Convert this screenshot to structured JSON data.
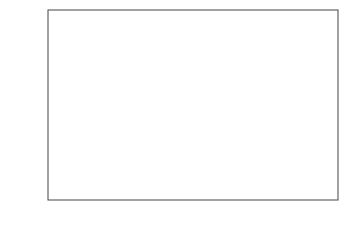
{
  "chart_data": {
    "type": "scatter",
    "title": "",
    "xlabel": "age",
    "ylabel": "ỹ",
    "xlim": [
      0.2,
      9.9
    ],
    "ylim": [
      8,
      95
    ],
    "xticks": [
      2,
      4,
      6,
      8
    ],
    "yticks": [
      20,
      40,
      60,
      80
    ],
    "grid": false,
    "legend": null,
    "fit_curve": {
      "x": [
        0.5,
        1.5,
        2.5,
        3.5,
        4.5,
        5.2,
        6,
        7,
        7.5,
        8.5,
        9.5
      ],
      "y": [
        23,
        35,
        46,
        54,
        59,
        60,
        59.5,
        55,
        52,
        43,
        31
      ]
    },
    "band_halfwidth": 15,
    "band_color": "#8c8c8c",
    "series": [
      {
        "age": 0.5,
        "y": [
          12,
          14,
          16,
          18,
          20,
          22,
          24,
          26,
          28,
          30,
          32,
          34,
          36,
          38,
          45
        ]
      },
      {
        "age": 1.5,
        "y": [
          30,
          32,
          34,
          36,
          38,
          40,
          42,
          44,
          46,
          48,
          50,
          52,
          54,
          56
        ]
      },
      {
        "age": 2.5,
        "y": [
          34,
          36,
          38,
          40,
          42,
          44,
          46,
          48,
          50,
          52,
          54,
          56,
          58,
          60,
          62,
          64,
          66,
          68,
          74
        ]
      },
      {
        "age": 3.5,
        "y": [
          36,
          40,
          44,
          46,
          48,
          50,
          52,
          54,
          56,
          58,
          60,
          62,
          64,
          66,
          68,
          70,
          72,
          74,
          76,
          80,
          86,
          91
        ]
      },
      {
        "age": 5,
        "y": [
          43,
          46,
          48,
          50,
          52,
          54,
          56,
          58,
          60,
          64,
          68,
          76,
          80,
          83,
          85,
          88
        ]
      },
      {
        "age": 7.5,
        "y": [
          38,
          45,
          47,
          49,
          51,
          53,
          56,
          69
        ]
      },
      {
        "age": 9.5,
        "y": [
          37,
          46,
          53
        ]
      }
    ]
  }
}
